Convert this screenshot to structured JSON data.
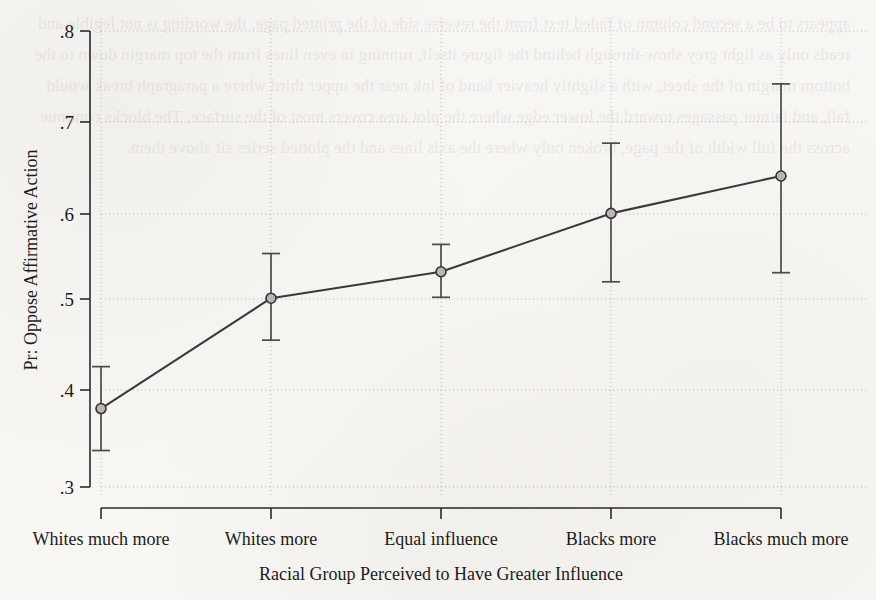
{
  "page": {
    "background_color": "#f7f6f3",
    "bleed_text": "appears to be a second column of faded text from the reverse side of the printed page, visible only as light grey show-through behind the figure"
  },
  "chart_data": {
    "type": "line",
    "title": "",
    "xlabel": "Racial Group Perceived to Have Greater Influence",
    "ylabel": "Pr: Oppose Affirmative Action",
    "categories": [
      "Whites much more",
      "Whites more",
      "Equal influence",
      "Blacks more",
      "Blacks much more"
    ],
    "values": [
      0.386,
      0.507,
      0.536,
      0.6,
      0.641
    ],
    "error_low": [
      0.34,
      0.461,
      0.508,
      0.525,
      0.535
    ],
    "error_high": [
      0.432,
      0.556,
      0.566,
      0.677,
      0.742
    ],
    "ylim": [
      0.3,
      0.8
    ],
    "yticks": [
      0.3,
      0.4,
      0.5,
      0.6,
      0.7,
      0.8
    ],
    "ytick_labels": [
      ".3",
      ".4",
      ".5",
      ".6",
      ".7",
      ".8"
    ],
    "grid": "dotted-both",
    "legend": "none",
    "marker": "circle",
    "line_color": "#3a3a3a",
    "marker_fill": "#b9b5b0",
    "grid_color": "#b9b5ad"
  }
}
